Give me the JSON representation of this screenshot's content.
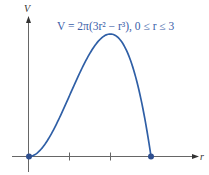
{
  "chart_data": {
    "type": "line",
    "title": "V = 2π(3r² − r³), 0 ≤ r ≤ 3",
    "xlabel": "r",
    "ylabel": "V",
    "xlim": [
      0,
      3.6
    ],
    "ylim": [
      0,
      25.13
    ],
    "grid": false,
    "x_ticks": [
      1,
      2
    ],
    "series": [
      {
        "name": "V = 2π(3r² − r³)",
        "color": "#2f5fa6",
        "x": [
          0,
          0.25,
          0.5,
          0.75,
          1.0,
          1.25,
          1.5,
          1.75,
          2.0,
          2.25,
          2.5,
          2.75,
          3.0
        ],
        "values": [
          0,
          1.08,
          3.93,
          7.95,
          12.57,
          17.18,
          21.21,
          24.05,
          25.13,
          23.86,
          19.63,
          11.88,
          0
        ]
      }
    ],
    "points": [
      {
        "x": 0,
        "y": 0,
        "label": "origin"
      },
      {
        "x": 3,
        "y": 0,
        "label": "endpoint"
      }
    ]
  },
  "labels": {
    "title": "V = 2π(3r² − r³), 0 ≤ r ≤ 3",
    "x_axis": "r",
    "y_axis": "V"
  },
  "colors": {
    "curve": "#2f5fa6",
    "axis": "#555555",
    "title": "#3b5ea8"
  }
}
